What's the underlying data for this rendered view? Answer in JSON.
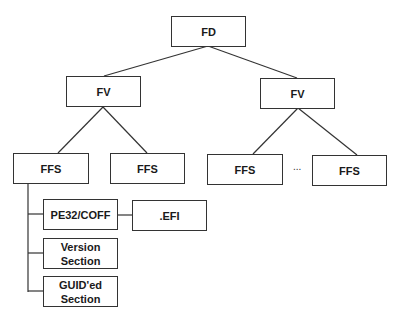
{
  "diagram": {
    "root": {
      "label": "FD"
    },
    "volumes": [
      {
        "label": "FV"
      },
      {
        "label": "FV"
      }
    ],
    "files": [
      {
        "label": "FFS"
      },
      {
        "label": "FFS"
      },
      {
        "label": "FFS"
      },
      {
        "label": "FFS"
      }
    ],
    "ellipsis": "...",
    "sections": [
      {
        "label": "PE32/COFF"
      },
      {
        "label": "Version Section"
      },
      {
        "label": "GUID'ed Section"
      }
    ],
    "efi": {
      "label": ".EFI"
    }
  }
}
